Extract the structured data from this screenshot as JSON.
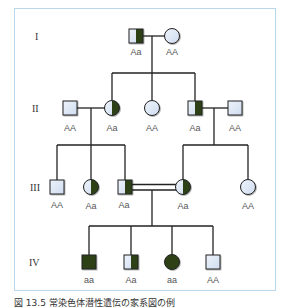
{
  "figure": {
    "caption": "図 13.5  常染色体潜性遺伝の家系図の例",
    "frame_color": "#b9d7ea",
    "colors": {
      "affected": "#2d4019",
      "unaffected": "#dde6f5",
      "line": "#222222"
    }
  },
  "generations": [
    {
      "label": "I",
      "y": 36
    },
    {
      "label": "II",
      "y": 108
    },
    {
      "label": "III",
      "y": 187
    },
    {
      "label": "IV",
      "y": 262
    }
  ],
  "individuals": [
    {
      "id": "I-1",
      "sex": "male",
      "status": "carrier",
      "genotype": "Aa",
      "x": 136,
      "y": 36
    },
    {
      "id": "I-2",
      "sex": "female",
      "status": "unaffected",
      "genotype": "AA",
      "x": 172,
      "y": 36
    },
    {
      "id": "II-1",
      "sex": "male",
      "status": "unaffected",
      "genotype": "AA",
      "x": 70,
      "y": 108
    },
    {
      "id": "II-2",
      "sex": "female",
      "status": "carrier",
      "genotype": "Aa",
      "x": 112,
      "y": 108
    },
    {
      "id": "II-3",
      "sex": "female",
      "status": "unaffected",
      "genotype": "AA",
      "x": 152,
      "y": 108
    },
    {
      "id": "II-4",
      "sex": "male",
      "status": "carrier",
      "genotype": "Aa",
      "x": 195,
      "y": 108
    },
    {
      "id": "II-5",
      "sex": "male",
      "status": "unaffected",
      "genotype": "AA",
      "x": 235,
      "y": 108
    },
    {
      "id": "III-1",
      "sex": "male",
      "status": "unaffected",
      "genotype": "AA",
      "x": 57,
      "y": 187
    },
    {
      "id": "III-2",
      "sex": "female",
      "status": "carrier",
      "genotype": "Aa",
      "x": 91,
      "y": 187
    },
    {
      "id": "III-3",
      "sex": "male",
      "status": "carrier",
      "genotype": "Aa",
      "x": 125,
      "y": 187
    },
    {
      "id": "III-4",
      "sex": "female",
      "status": "carrier",
      "genotype": "Aa",
      "x": 183,
      "y": 187
    },
    {
      "id": "III-5",
      "sex": "female",
      "status": "unaffected",
      "genotype": "AA",
      "x": 248,
      "y": 187
    },
    {
      "id": "IV-1",
      "sex": "male",
      "status": "affected",
      "genotype": "aa",
      "x": 89,
      "y": 262
    },
    {
      "id": "IV-2",
      "sex": "male",
      "status": "carrier",
      "genotype": "Aa",
      "x": 131,
      "y": 262
    },
    {
      "id": "IV-3",
      "sex": "female",
      "status": "affected",
      "genotype": "aa",
      "x": 172,
      "y": 262
    },
    {
      "id": "IV-4",
      "sex": "male",
      "status": "unaffected",
      "genotype": "AA",
      "x": 213,
      "y": 262
    }
  ],
  "legend_note": "carrier = half-filled (right half dark), affected = fully filled, consanguineous marriage = double line between III-3 and III-4"
}
